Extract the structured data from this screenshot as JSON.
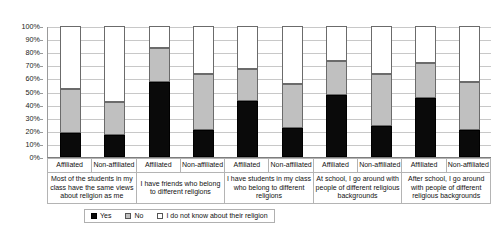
{
  "chart_data": {
    "type": "bar",
    "subtype": "stacked-100-percent",
    "title": "",
    "xlabel": "",
    "ylabel": "",
    "ylim": [
      0,
      100
    ],
    "ytick_labels": [
      "100%",
      "90%",
      "80%",
      "70%",
      "60%",
      "50%",
      "40%",
      "30%",
      "20%",
      "10%",
      "0%"
    ],
    "ytick_values": [
      100,
      90,
      80,
      70,
      60,
      50,
      40,
      30,
      20,
      10,
      0
    ],
    "grid": true,
    "legend_position": "bottom",
    "categories": [
      "Affiliated",
      "Non-affiliated",
      "Affiliated",
      "Non-affiliated",
      "Affiliated",
      "Non-affiliated",
      "Affiliated",
      "Non-affiliated",
      "Affiliated",
      "Non-affiliated"
    ],
    "groups": [
      "Most of the students in my class have the same views about religion as me",
      "I have friends who belong to different religions",
      "I have students in my class who belong to different religions",
      "At school, I go around with people of different religious backgrounds",
      "After school, I go around with  people of different religious backgrounds"
    ],
    "series": [
      {
        "name": "Yes",
        "color": "#0a0a0a",
        "values": [
          18,
          17,
          57,
          21,
          43,
          22,
          47,
          24,
          45,
          21
        ]
      },
      {
        "name": "No",
        "color": "#c0c0c0",
        "values": [
          34,
          25,
          26,
          42,
          24,
          34,
          26,
          39,
          27,
          36
        ]
      },
      {
        "name": "I do not know about their religion",
        "color": "#ffffff",
        "values": [
          48,
          58,
          17,
          37,
          33,
          44,
          27,
          37,
          28,
          43
        ]
      }
    ]
  },
  "legend": {
    "items": [
      {
        "label": "Yes",
        "swatch": "swatch-yes"
      },
      {
        "label": "No",
        "swatch": "swatch-no"
      },
      {
        "label": "I do not know about their religion",
        "swatch": "swatch-unknown"
      }
    ]
  },
  "axis": {
    "y_ticks": [
      "100%",
      "90%",
      "80%",
      "70%",
      "60%",
      "50%",
      "40%",
      "30%",
      "20%",
      "10%",
      "0%"
    ]
  },
  "colors": {
    "yes": "#0a0a0a",
    "no": "#c0c0c0",
    "unknown": "#ffffff",
    "gridline": "#c8c8c8",
    "axis": "#9a9a9a",
    "border": "#b4b4b4"
  }
}
